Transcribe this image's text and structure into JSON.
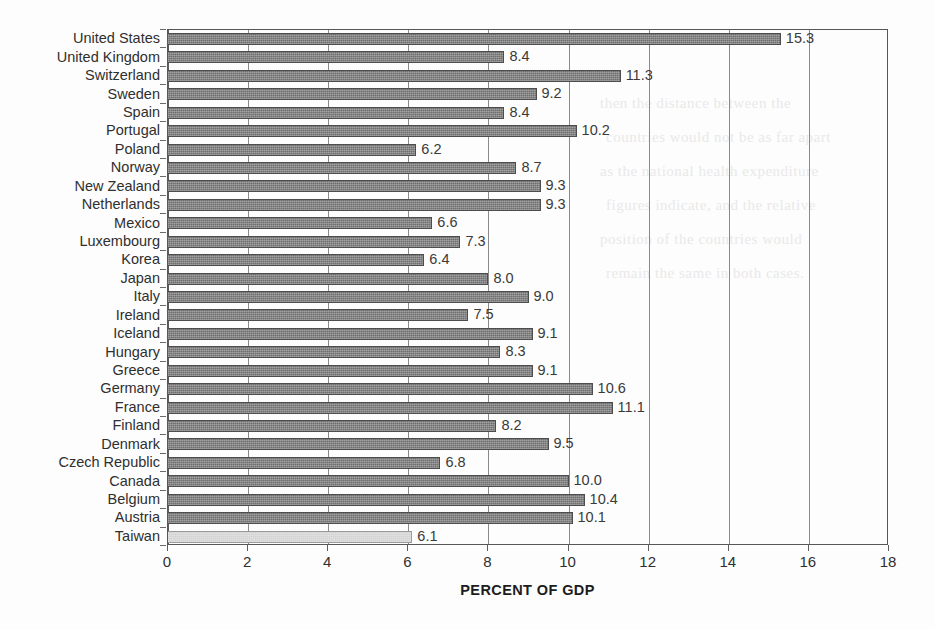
{
  "chart_data": {
    "type": "bar",
    "orientation": "horizontal",
    "title": "",
    "xlabel": "PERCENT OF GDP",
    "ylabel": "",
    "xlim": [
      0,
      18
    ],
    "xticks": [
      0,
      2,
      4,
      6,
      8,
      10,
      12,
      14,
      16,
      18
    ],
    "grid": "vertical",
    "legend": "none",
    "highlight_category": "Taiwan",
    "categories": [
      "United States",
      "United Kingdom",
      "Switzerland",
      "Sweden",
      "Spain",
      "Portugal",
      "Poland",
      "Norway",
      "New Zealand",
      "Netherlands",
      "Mexico",
      "Luxembourg",
      "Korea",
      "Japan",
      "Italy",
      "Ireland",
      "Iceland",
      "Hungary",
      "Greece",
      "Germany",
      "France",
      "Finland",
      "Denmark",
      "Czech Republic",
      "Canada",
      "Belgium",
      "Austria",
      "Taiwan"
    ],
    "values": [
      15.3,
      8.4,
      11.3,
      9.2,
      8.4,
      10.2,
      6.2,
      8.7,
      9.3,
      9.3,
      6.6,
      7.3,
      6.4,
      8.0,
      9.0,
      7.5,
      9.1,
      8.3,
      9.1,
      10.6,
      11.1,
      8.2,
      9.5,
      6.8,
      10.0,
      10.4,
      10.1,
      6.1
    ],
    "value_labels": [
      "15.3",
      "8.4",
      "11.3",
      "9.2",
      "8.4",
      "10.2",
      "6.2",
      "8.7",
      "9.3",
      "9.3",
      "6.6",
      "7.3",
      "6.4",
      "8.0",
      "9.0",
      "7.5",
      "9.1",
      "8.3",
      "9.1",
      "10.6",
      "11.1",
      "8.2",
      "9.5",
      "6.8",
      "10.0",
      "10.4",
      "10.1",
      "6.1"
    ]
  },
  "colors": {
    "bar": "#6e6e6e",
    "bar_highlight": "#d2d2d2",
    "axis": "#575757",
    "gridline": "#8a8a8a",
    "text": "#2f2f2f",
    "background": "#fdfdfd"
  },
  "ghost_artifacts": [
    "then the distance between the",
    "countries would not be as far apart",
    "as the national health expenditure",
    "figures indicate, and the relative",
    "position of the countries would",
    "remain the same in both cases."
  ]
}
